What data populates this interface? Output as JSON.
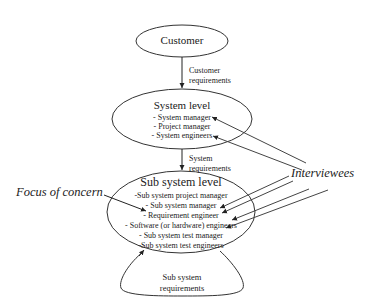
{
  "diagram": {
    "nodes": {
      "customer": {
        "title": "Customer"
      },
      "system_level": {
        "title": "System level",
        "members": [
          "- System manager",
          "- Project manager",
          "- System engineers"
        ]
      },
      "sub_system_level": {
        "title": "Sub system level",
        "members": [
          "-Sub system project manager",
          "- Sub system manager",
          "- Requirement engineer",
          "- Software (or hardware) engineers",
          "- Sub system test manager",
          "-Sub system test engineers"
        ]
      },
      "sub_system_requirements": {
        "line1": "Sub system",
        "line2": "requirements"
      }
    },
    "edges": {
      "customer_to_system": {
        "line1": "Customer",
        "line2": "requirements"
      },
      "system_to_subsystem": {
        "line1": "System",
        "line2": "requirements"
      }
    },
    "annotations": {
      "focus": "Focus of concern",
      "interviewees": "Interviewees"
    },
    "colors": {
      "stroke": "#333333",
      "text": "#222222",
      "background": "#ffffff"
    }
  }
}
